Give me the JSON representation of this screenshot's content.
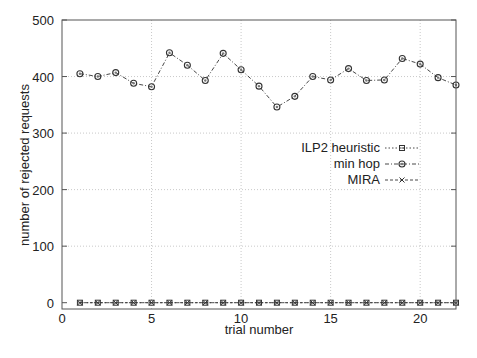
{
  "chart_data": {
    "type": "line",
    "title": "",
    "xlabel": "trial number",
    "ylabel": "number of rejected requests",
    "xlim": [
      0,
      22
    ],
    "ylim": [
      0,
      500
    ],
    "xticks": [
      0,
      5,
      10,
      15,
      20
    ],
    "yticks": [
      0,
      100,
      200,
      300,
      400,
      500
    ],
    "grid": true,
    "legend_position": "upper right (inside, below curve)",
    "x": [
      1,
      2,
      3,
      4,
      5,
      6,
      7,
      8,
      9,
      10,
      11,
      12,
      13,
      14,
      15,
      16,
      17,
      18,
      19,
      20,
      21,
      22
    ],
    "series": [
      {
        "name": "ILP2 heuristic",
        "marker": "square",
        "linestyle": "dotted",
        "values": [
          0,
          0,
          0,
          0,
          0,
          0,
          0,
          0,
          0,
          0,
          0,
          0,
          0,
          0,
          0,
          0,
          0,
          0,
          0,
          0,
          0,
          0
        ]
      },
      {
        "name": "min hop",
        "marker": "circle",
        "linestyle": "dash-dot",
        "values": [
          405,
          400,
          407,
          388,
          382,
          442,
          420,
          393,
          441,
          412,
          383,
          346,
          365,
          400,
          394,
          414,
          393,
          394,
          432,
          422,
          398,
          385
        ]
      },
      {
        "name": "MIRA",
        "marker": "x",
        "linestyle": "dashed",
        "values": [
          0,
          0,
          0,
          0,
          0,
          0,
          0,
          0,
          0,
          0,
          0,
          0,
          0,
          0,
          0,
          0,
          0,
          0,
          0,
          0,
          0,
          0
        ]
      }
    ]
  },
  "labels": {
    "xlabel": "trial number",
    "ylabel": "number of rejected requests",
    "legend": [
      "ILP2 heuristic",
      "min hop",
      "MIRA"
    ]
  }
}
